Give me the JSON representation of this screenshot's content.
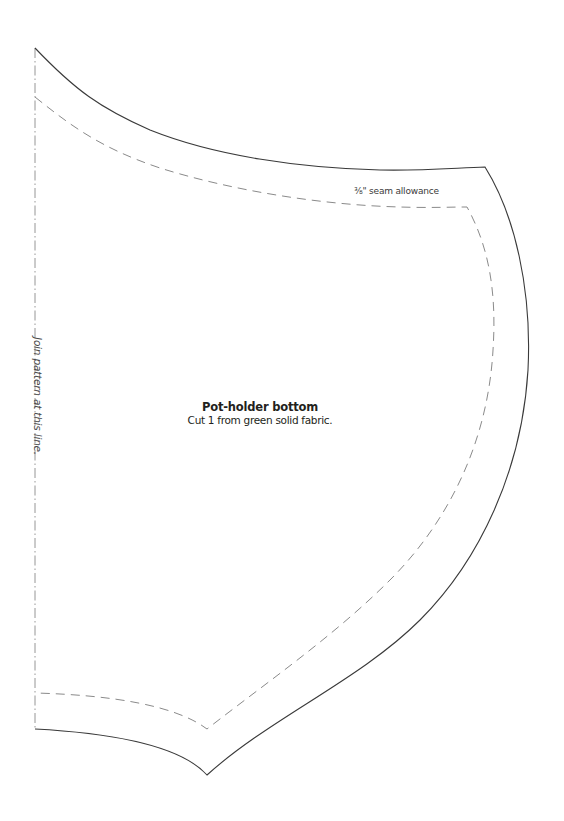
{
  "pattern": {
    "piece_title": "Pot-holder bottom",
    "cut_instruction": "Cut 1 from green solid fabric.",
    "seam_allowance_label": "⅜\" seam allowance",
    "fold_line_label": "Join pattern at this line."
  },
  "colors": {
    "cut_line": "#3a3a3a",
    "seam_line": "#8a8a8a",
    "text": "#231f20",
    "background": "#ffffff"
  }
}
